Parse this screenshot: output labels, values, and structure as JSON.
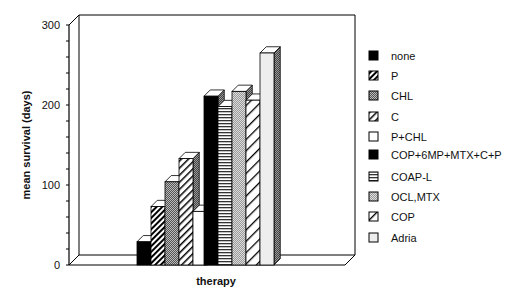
{
  "chart_data": {
    "type": "bar",
    "title": "",
    "xlabel": "therapy",
    "ylabel": "mean   survival   (days)",
    "ylim": [
      0,
      300
    ],
    "yticks": [
      0,
      100,
      200,
      300
    ],
    "grid": false,
    "legend_position": "right",
    "style": "3d",
    "categories": [
      "none",
      "P",
      "CHL",
      "C",
      "P+CHL",
      "COP+6MP+MTX+C+P",
      "COAP-L",
      "OCL,MTX",
      "COP",
      "Adria"
    ],
    "values": [
      29,
      73,
      104,
      133,
      67,
      211,
      198,
      217,
      206,
      265
    ],
    "legend": [
      "none",
      "P",
      "CHL",
      "C",
      "P+CHL",
      "COP+6MP+MTX+C+P",
      "COAP-L",
      "OCL,MTX",
      "COP",
      "Adria"
    ],
    "patterns": [
      "solid-black",
      "diag-dense",
      "checker-dark",
      "diag-light",
      "white",
      "solid-black",
      "horizontal",
      "checker-light",
      "diag-wide",
      "light-gray"
    ]
  }
}
